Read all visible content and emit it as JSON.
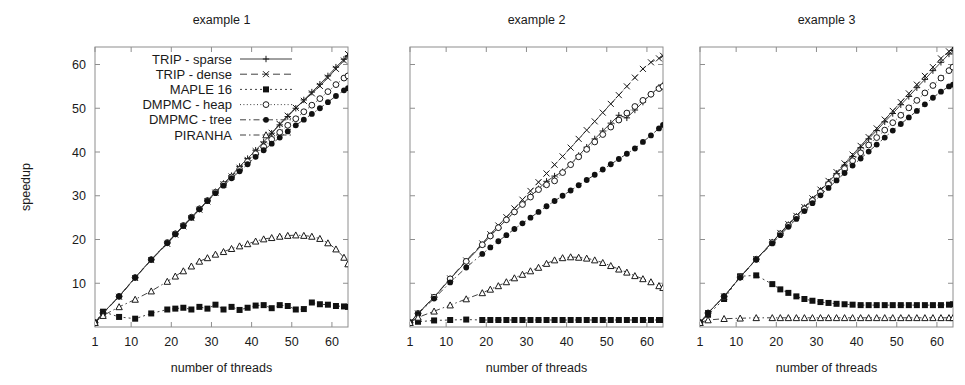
{
  "figure": {
    "xlabel": "number of threads",
    "ylabel": "speedup",
    "xticks": [
      1,
      10,
      20,
      30,
      40,
      50,
      60
    ],
    "yticks": [
      10,
      20,
      30,
      40,
      50,
      60
    ],
    "xlim": [
      1,
      64
    ],
    "ylim": [
      0,
      64
    ],
    "grid": false,
    "legend_position": "top-left of panel 1"
  },
  "legend": {
    "entries": [
      {
        "label": "TRIP - sparse",
        "marker": "plus",
        "dash": "none",
        "color": "#2b2b2b"
      },
      {
        "label": "TRIP - dense",
        "marker": "cross",
        "dash": "dash",
        "color": "#2b2b2b"
      },
      {
        "label": "MAPLE 16",
        "marker": "filled-square",
        "dash": "dot",
        "color": "#111111"
      },
      {
        "label": "DMPMC - heap",
        "marker": "open-circle",
        "dash": "dense",
        "color": "#2b2b2b"
      },
      {
        "label": "DMPMC - tree",
        "marker": "filled-circle",
        "dash": "dashdot",
        "color": "#111111"
      },
      {
        "label": "PIRANHA",
        "marker": "open-triangle",
        "dash": "dashdot",
        "color": "#2b2b2b"
      }
    ]
  },
  "chart_data": [
    {
      "type": "line",
      "title": "example 1",
      "xlabel": "number of threads",
      "ylabel": "speedup",
      "xlim": [
        1,
        64
      ],
      "ylim": [
        0,
        64
      ],
      "xticks": [
        1,
        10,
        20,
        30,
        40,
        50,
        60
      ],
      "yticks": [
        10,
        20,
        30,
        40,
        50,
        60
      ],
      "x": [
        1,
        3,
        7,
        11,
        15,
        19,
        21,
        23,
        25,
        27,
        29,
        31,
        33,
        35,
        37,
        39,
        41,
        43,
        45,
        47,
        49,
        51,
        53,
        55,
        57,
        59,
        61,
        63,
        64
      ],
      "series": [
        {
          "name": "TRIP - sparse",
          "values": [
            1,
            3.2,
            7.0,
            11.3,
            15.4,
            19.2,
            21.3,
            23.2,
            25.1,
            27.0,
            28.9,
            30.9,
            32.8,
            34.6,
            36.7,
            38.5,
            40.4,
            42.3,
            44.3,
            46.2,
            48.1,
            50.0,
            51.9,
            53.7,
            55.5,
            57.4,
            59.4,
            61.2,
            62.0
          ]
        },
        {
          "name": "TRIP - dense",
          "values": [
            1,
            3.1,
            6.9,
            11.2,
            15.3,
            19.0,
            21.1,
            23.0,
            24.9,
            26.8,
            28.7,
            30.7,
            32.6,
            34.4,
            36.4,
            38.2,
            40.2,
            41.7,
            44.4,
            46.4,
            48.3,
            50.1,
            51.7,
            53.4,
            55.1,
            57.0,
            59.0,
            60.9,
            62.4
          ]
        },
        {
          "name": "MAPLE 16",
          "values": [
            1,
            3.5,
            2.3,
            1.9,
            3.1,
            4.0,
            4.2,
            4.4,
            4.0,
            4.6,
            4.2,
            5.1,
            4.0,
            4.6,
            3.9,
            4.4,
            4.9,
            5.0,
            4.3,
            5.0,
            4.8,
            4.0,
            4.1,
            5.6,
            5.2,
            5.1,
            4.8,
            4.7,
            4.6
          ]
        },
        {
          "name": "DMPMC - heap",
          "values": [
            1,
            3.2,
            7.0,
            11.3,
            15.4,
            19.3,
            21.3,
            23.2,
            25.1,
            27.0,
            28.9,
            30.8,
            32.6,
            34.3,
            36.0,
            37.8,
            39.6,
            41.2,
            42.9,
            44.5,
            46.1,
            47.6,
            49.2,
            50.7,
            52.2,
            53.8,
            55.4,
            56.9,
            57.4
          ]
        },
        {
          "name": "DMPMC - tree",
          "values": [
            1,
            3.2,
            7.0,
            11.3,
            15.4,
            19.2,
            21.2,
            23.1,
            25.0,
            26.9,
            28.8,
            30.6,
            32.3,
            34.0,
            35.6,
            37.2,
            38.9,
            40.4,
            41.9,
            43.3,
            44.7,
            46.1,
            47.4,
            48.7,
            50.0,
            51.4,
            52.8,
            54.1,
            54.6
          ]
        },
        {
          "name": "PIRANHA",
          "values": [
            1,
            2.6,
            4.6,
            6.3,
            8.2,
            10.4,
            11.6,
            12.8,
            13.9,
            15.0,
            15.8,
            16.6,
            17.2,
            17.9,
            18.5,
            19.0,
            19.6,
            20.1,
            20.4,
            20.7,
            20.9,
            21.0,
            20.9,
            20.7,
            20.2,
            19.2,
            17.8,
            15.9,
            14.4
          ]
        }
      ]
    },
    {
      "type": "line",
      "title": "example 2",
      "xlabel": "number of threads",
      "ylabel": "speedup",
      "xlim": [
        1,
        64
      ],
      "ylim": [
        0,
        64
      ],
      "xticks": [
        1,
        10,
        20,
        30,
        40,
        50,
        60
      ],
      "yticks": [
        10,
        20,
        30,
        40,
        50,
        60
      ],
      "x": [
        1,
        3,
        7,
        11,
        15,
        19,
        21,
        23,
        25,
        27,
        29,
        31,
        33,
        35,
        37,
        39,
        41,
        43,
        45,
        47,
        49,
        51,
        53,
        55,
        57,
        59,
        61,
        63,
        64
      ],
      "series": [
        {
          "name": "TRIP - sparse",
          "values": [
            1,
            3.1,
            6.8,
            11.0,
            15.0,
            18.8,
            20.8,
            22.7,
            24.5,
            26.3,
            28.1,
            29.9,
            31.6,
            33.3,
            34.5,
            35.5,
            37.2,
            39.2,
            41.1,
            43.0,
            44.8,
            46.6,
            48.4,
            47.8,
            49.6,
            51.4,
            53.2,
            54.8,
            55.3
          ]
        },
        {
          "name": "TRIP - dense",
          "values": [
            1,
            3.1,
            6.9,
            11.1,
            15.2,
            19.1,
            21.2,
            23.2,
            25.1,
            27.1,
            29.1,
            31.1,
            33.1,
            35.1,
            37.1,
            39.0,
            41.0,
            43.0,
            45.0,
            47.0,
            49.0,
            51.0,
            53.0,
            55.0,
            57.0,
            59.0,
            60.5,
            61.4,
            62.0
          ]
        },
        {
          "name": "MAPLE 16",
          "values": [
            1,
            1.2,
            1.5,
            1.6,
            1.7,
            1.6,
            1.6,
            1.6,
            1.6,
            1.6,
            1.6,
            1.6,
            1.6,
            1.6,
            1.6,
            1.6,
            1.6,
            1.6,
            1.6,
            1.6,
            1.6,
            1.6,
            1.6,
            1.6,
            1.6,
            1.6,
            1.6,
            1.6,
            1.6
          ]
        },
        {
          "name": "DMPMC - heap",
          "values": [
            1,
            3.1,
            6.8,
            11.0,
            15.0,
            18.8,
            20.8,
            22.7,
            24.5,
            26.3,
            28.0,
            29.7,
            31.4,
            32.5,
            33.4,
            35.3,
            37.1,
            38.9,
            40.6,
            42.3,
            44.0,
            45.7,
            47.3,
            48.9,
            50.4,
            51.8,
            53.2,
            54.5,
            55.0
          ]
        },
        {
          "name": "DMPMC - tree",
          "values": [
            1,
            3.0,
            6.5,
            10.2,
            13.6,
            16.7,
            18.2,
            19.6,
            21.0,
            22.4,
            23.7,
            25.0,
            26.3,
            27.6,
            28.8,
            30.0,
            31.2,
            32.4,
            33.6,
            34.8,
            36.0,
            37.2,
            38.4,
            39.6,
            40.8,
            42.3,
            43.8,
            45.4,
            46.2
          ]
        },
        {
          "name": "PIRANHA",
          "values": [
            1,
            2.2,
            3.6,
            5.0,
            6.4,
            7.8,
            8.6,
            9.4,
            10.3,
            11.2,
            12.0,
            12.8,
            13.6,
            14.5,
            15.3,
            15.8,
            16.0,
            15.9,
            15.7,
            15.3,
            14.7,
            14.0,
            13.2,
            12.5,
            11.7,
            11.0,
            10.3,
            9.4,
            9.0
          ]
        }
      ]
    },
    {
      "type": "line",
      "title": "example 3",
      "xlabel": "number of threads",
      "ylabel": "speedup",
      "xlim": [
        1,
        64
      ],
      "ylim": [
        0,
        64
      ],
      "xticks": [
        1,
        10,
        20,
        30,
        40,
        50,
        60
      ],
      "yticks": [
        10,
        20,
        30,
        40,
        50,
        60
      ],
      "x": [
        1,
        3,
        7,
        11,
        15,
        19,
        21,
        23,
        25,
        27,
        29,
        31,
        33,
        35,
        37,
        39,
        41,
        43,
        45,
        47,
        49,
        51,
        53,
        55,
        57,
        59,
        61,
        63,
        64
      ],
      "series": [
        {
          "name": "TRIP - sparse",
          "values": [
            1,
            3.2,
            7.0,
            11.4,
            15.5,
            19.4,
            21.4,
            23.4,
            25.3,
            27.3,
            29.2,
            31.2,
            33.1,
            35.1,
            37.0,
            39.0,
            41.0,
            43.0,
            44.9,
            46.9,
            48.8,
            50.8,
            52.7,
            54.7,
            56.6,
            58.6,
            60.5,
            62.4,
            63.2
          ]
        },
        {
          "name": "TRIP - dense",
          "values": [
            1,
            3.2,
            7.0,
            11.4,
            15.5,
            19.4,
            21.5,
            23.5,
            25.4,
            27.4,
            29.4,
            31.4,
            33.4,
            35.4,
            37.4,
            39.4,
            41.4,
            43.4,
            45.4,
            47.4,
            49.4,
            51.4,
            53.4,
            55.4,
            57.4,
            59.4,
            61.4,
            63.0,
            63.8
          ]
        },
        {
          "name": "MAPLE 16",
          "values": [
            1,
            2.8,
            6.4,
            11.6,
            11.8,
            9.8,
            8.6,
            7.8,
            7.0,
            6.4,
            6.0,
            5.7,
            5.5,
            5.3,
            5.2,
            5.1,
            5.0,
            5.0,
            5.0,
            5.0,
            5.0,
            5.0,
            5.0,
            5.0,
            5.0,
            5.0,
            5.0,
            5.1,
            5.2
          ]
        },
        {
          "name": "DMPMC - heap",
          "values": [
            1,
            3.2,
            7.0,
            11.4,
            15.5,
            19.3,
            21.3,
            23.2,
            25.1,
            27.0,
            28.9,
            30.8,
            32.6,
            34.4,
            36.2,
            38.0,
            39.8,
            41.6,
            43.3,
            45.0,
            46.7,
            48.4,
            50.1,
            51.8,
            53.5,
            55.2,
            56.9,
            58.6,
            59.4
          ]
        },
        {
          "name": "DMPMC - tree",
          "values": [
            1,
            3.2,
            7.0,
            11.3,
            15.4,
            19.1,
            21.0,
            22.9,
            24.7,
            26.5,
            28.3,
            30.1,
            31.8,
            33.5,
            35.2,
            36.9,
            38.5,
            40.1,
            41.7,
            43.3,
            44.9,
            46.4,
            47.9,
            49.4,
            50.9,
            52.4,
            53.8,
            55.0,
            55.4
          ]
        },
        {
          "name": "PIRANHA",
          "values": [
            1,
            1.6,
            1.9,
            2.0,
            2.1,
            2.1,
            2.1,
            2.1,
            2.1,
            2.1,
            2.1,
            2.1,
            2.1,
            2.1,
            2.1,
            2.1,
            2.1,
            2.1,
            2.1,
            2.1,
            2.1,
            2.1,
            2.1,
            2.1,
            2.1,
            2.1,
            2.1,
            2.1,
            2.1
          ]
        }
      ]
    }
  ]
}
